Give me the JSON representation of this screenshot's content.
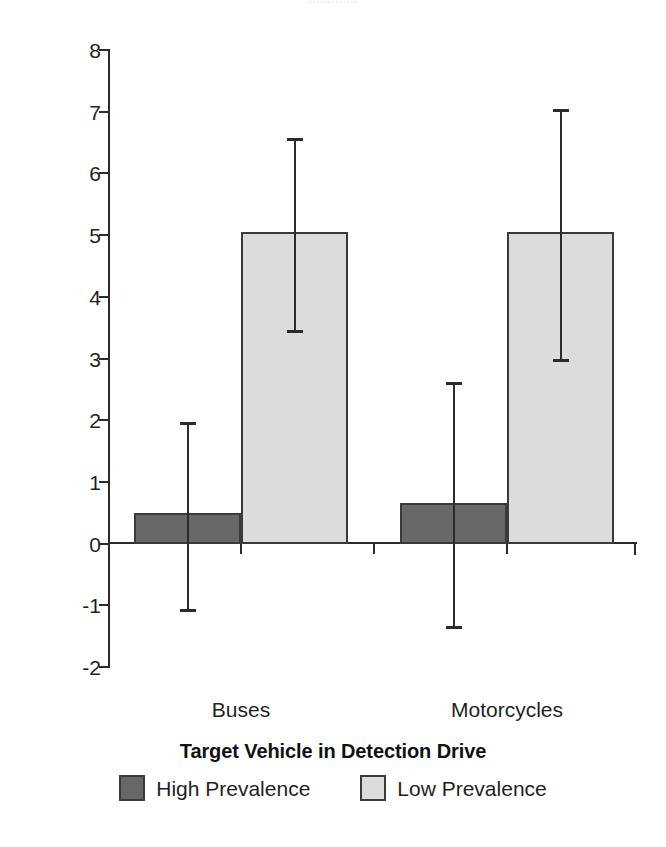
{
  "figure": {
    "clipped_top_text": "............."
  },
  "chart_data": {
    "type": "bar",
    "title": "",
    "xlabel": "Target Vehicle in Detection Drive",
    "ylabel": "Proportion of target vehicles missed (%)",
    "categories": [
      "Buses",
      "Motorcycles"
    ],
    "ylim": [
      -2,
      8
    ],
    "yticks": [
      8,
      7,
      6,
      5,
      4,
      3,
      2,
      1,
      0,
      -1,
      -2
    ],
    "ytick_labels": [
      "8",
      "7",
      "6",
      "5",
      "4",
      "3",
      "2",
      "1",
      "0",
      "-1",
      "-2"
    ],
    "grid": false,
    "legend_position": "bottom",
    "series": [
      {
        "name": "High Prevalence",
        "color": "#686868",
        "values": [
          0.5,
          0.65
        ],
        "err_upper": [
          1.95,
          2.6
        ],
        "err_lower": [
          -1.08,
          -1.35
        ]
      },
      {
        "name": "Low Prevalence",
        "color": "#dcdcdc",
        "values": [
          5.05,
          5.05
        ],
        "err_upper": [
          6.55,
          7.03
        ],
        "err_lower": [
          3.45,
          2.98
        ]
      }
    ]
  },
  "axis": {
    "line_color": "#2b2b2b",
    "bar_border_color": "#3a3a3a"
  }
}
